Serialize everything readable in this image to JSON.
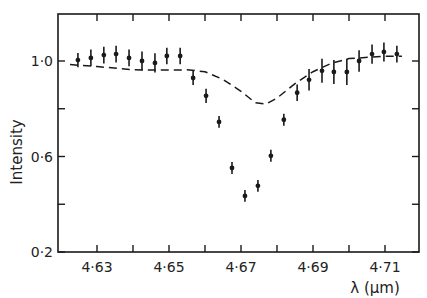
{
  "chart_data": {
    "type": "scatter",
    "title": "",
    "xlabel": "λ  (μm)",
    "ylabel": "Intensity",
    "xlim": [
      4.6247,
      4.7147
    ],
    "ylim": [
      0.2,
      1.2
    ],
    "x_ticks": [
      4.63,
      4.64,
      4.65,
      4.66,
      4.67,
      4.68,
      4.69,
      4.7,
      4.71
    ],
    "x_tick_labels": [
      "4·63",
      "",
      "4·65",
      "",
      "4·67",
      "",
      "4·69",
      "",
      "4·71"
    ],
    "y_ticks": [
      0.2,
      0.4,
      0.6,
      0.8,
      1.0
    ],
    "y_tick_labels": [
      "0·2",
      "",
      "0·6",
      "",
      "1·0"
    ],
    "grid": false,
    "legend": null,
    "series": [
      {
        "name": "measured",
        "style": "points-with-errorbars",
        "x": [
          4.6247,
          4.6283,
          4.6319,
          4.6353,
          4.6389,
          4.6425,
          4.6461,
          4.6494,
          4.6531,
          4.6567,
          4.6603,
          4.6639,
          4.6675,
          4.6711,
          4.6747,
          4.6783,
          4.6819,
          4.6856,
          4.6889,
          4.6925,
          4.6958,
          4.6994,
          4.7028,
          4.7064,
          4.7097,
          4.7133
        ],
        "y": [
          1.004,
          1.013,
          1.025,
          1.029,
          1.013,
          1.0,
          0.992,
          1.021,
          1.021,
          0.929,
          0.854,
          0.745,
          0.552,
          0.435,
          0.477,
          0.603,
          0.754,
          0.867,
          0.921,
          0.959,
          0.954,
          0.954,
          1.0,
          1.029,
          1.038,
          1.029
        ],
        "yerr": [
          0.03,
          0.035,
          0.035,
          0.035,
          0.035,
          0.04,
          0.04,
          0.035,
          0.035,
          0.03,
          0.03,
          0.025,
          0.025,
          0.025,
          0.025,
          0.025,
          0.025,
          0.035,
          0.045,
          0.05,
          0.05,
          0.055,
          0.045,
          0.04,
          0.04,
          0.035
        ]
      },
      {
        "name": "model",
        "style": "dashed-line",
        "x": [
          4.6225,
          4.63,
          4.64,
          4.65,
          4.655,
          4.66,
          4.665,
          4.67,
          4.674,
          4.677,
          4.68,
          4.685,
          4.69,
          4.695,
          4.7,
          4.71,
          4.7147
        ],
        "y": [
          0.985,
          0.977,
          0.963,
          0.962,
          0.963,
          0.955,
          0.923,
          0.873,
          0.825,
          0.82,
          0.845,
          0.905,
          0.955,
          0.99,
          1.01,
          1.02,
          1.02
        ]
      }
    ]
  }
}
